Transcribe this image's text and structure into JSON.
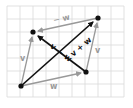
{
  "diagram": {
    "grid": {
      "x0": 7,
      "y0": 6,
      "x1": 124,
      "y1": 97,
      "cell": 13,
      "color": "#d9d9d9"
    },
    "points": {
      "origin": {
        "x": 21,
        "y": 86
      },
      "v_tip": {
        "x": 33,
        "y": 32
      },
      "w_tip": {
        "x": 86,
        "y": 72
      },
      "sum_tip": {
        "x": 98,
        "y": 18
      }
    },
    "colors": {
      "black": "#111111",
      "gray": "#999999"
    },
    "labels": {
      "v_left": "v",
      "w_bottom": "w",
      "v_right": "v",
      "neg_w_top": "− w",
      "v_plus_w": "v + w",
      "v_minus_w": "v − w"
    }
  }
}
